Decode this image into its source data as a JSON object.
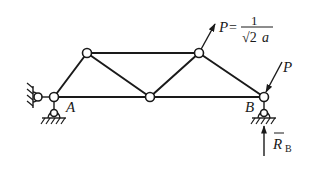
{
  "diagram": {
    "type": "truss",
    "nodes": {
      "A": {
        "label": "A"
      },
      "B": {
        "label": "B"
      }
    },
    "loads": {
      "P_top": {
        "symbol": "P",
        "equals": "=",
        "numerator": "1",
        "denominator_root": "√2",
        "denominator_var": "a"
      },
      "P_right": {
        "symbol": "P"
      }
    },
    "reaction": {
      "symbol": "R",
      "subscript": "B"
    }
  }
}
